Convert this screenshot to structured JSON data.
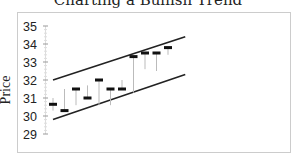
{
  "chart_data": {
    "type": "candlestick",
    "title": "Charting a Bullish Trend",
    "xlabel": "",
    "ylabel": "Price",
    "ylim": [
      29,
      35
    ],
    "yticks": [
      29,
      30,
      31,
      32,
      33,
      34,
      35
    ],
    "grid": false,
    "legend": null,
    "bars": [
      {
        "index": 1,
        "low": 30.3,
        "high": 31.0,
        "close": 30.65
      },
      {
        "index": 2,
        "low": 30.3,
        "high": 31.5,
        "close": 30.3
      },
      {
        "index": 3,
        "low": 30.6,
        "high": 31.5,
        "close": 31.5
      },
      {
        "index": 4,
        "low": 31.0,
        "high": 31.7,
        "close": 31.0
      },
      {
        "index": 5,
        "low": 30.6,
        "high": 32.0,
        "close": 32.0
      },
      {
        "index": 6,
        "low": 30.6,
        "high": 31.5,
        "close": 31.5
      },
      {
        "index": 7,
        "low": 31.5,
        "high": 32.0,
        "close": 31.5
      },
      {
        "index": 8,
        "low": 31.3,
        "high": 33.3,
        "close": 33.3
      },
      {
        "index": 9,
        "low": 32.6,
        "high": 33.5,
        "close": 33.5
      },
      {
        "index": 10,
        "low": 32.5,
        "high": 33.5,
        "close": 33.5
      },
      {
        "index": 11,
        "low": 33.4,
        "high": 33.8,
        "close": 33.8
      }
    ],
    "trendlines": [
      {
        "name": "upper channel",
        "start": {
          "bar": 1,
          "value": 32.0
        },
        "end": {
          "bar": 12.5,
          "value": 34.4
        }
      },
      {
        "name": "lower channel",
        "start": {
          "bar": 1,
          "value": 29.8
        },
        "end": {
          "bar": 12.5,
          "value": 32.3
        }
      }
    ],
    "colors": {
      "bars": "#111111",
      "wicks": "#bbbbbb",
      "trendlines": "#222222",
      "frame": "#cccccc",
      "axis": "#999999"
    }
  }
}
